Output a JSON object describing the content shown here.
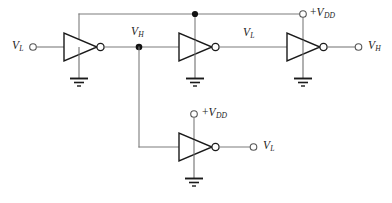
{
  "diagram": {
    "type": "circuit-schematic",
    "colors": {
      "background": "#ffffff",
      "wire": "#7c7c7c",
      "symbol_outline": "#1a1a1a",
      "junction": "#111111",
      "text": "#1c1c1c"
    }
  },
  "labels": {
    "input_vl": {
      "base": "V",
      "sub": "L"
    },
    "node_vh": {
      "base": "V",
      "sub": "H"
    },
    "mid_vl": {
      "base": "V",
      "sub": "L"
    },
    "output_vh": {
      "base": "V",
      "sub": "H"
    },
    "vdd_top": {
      "prefix": "+",
      "base": "V",
      "sub": "DD"
    },
    "vdd_bottom": {
      "prefix": "+",
      "base": "V",
      "sub": "DD"
    },
    "output_vl_bottom": {
      "base": "V",
      "sub": "L"
    }
  },
  "components": {
    "inverters": [
      {
        "name": "inverter-1",
        "supply": "from-top-rail",
        "ground": true
      },
      {
        "name": "inverter-2",
        "supply": "from-top-rail",
        "ground": true
      },
      {
        "name": "inverter-3",
        "supply": "from-top-rail",
        "ground": true
      },
      {
        "name": "inverter-4",
        "supply": "vdd-terminal",
        "ground": true
      }
    ],
    "terminals": [
      {
        "name": "input-terminal-vl",
        "label": "V_L"
      },
      {
        "name": "vdd-terminal-top",
        "label": "+V_DD"
      },
      {
        "name": "output-terminal-vh",
        "label": "V_H"
      },
      {
        "name": "vdd-terminal-bottom",
        "label": "+V_DD"
      },
      {
        "name": "output-terminal-vl",
        "label": "V_L"
      }
    ],
    "junctions": [
      {
        "name": "junction-vdd-rail",
        "x": 195,
        "y": 14
      },
      {
        "name": "junction-vh-node",
        "x": 139,
        "y": 48
      }
    ],
    "grounds": [
      {
        "name": "ground-1"
      },
      {
        "name": "ground-2"
      },
      {
        "name": "ground-3"
      },
      {
        "name": "ground-4"
      }
    ]
  }
}
